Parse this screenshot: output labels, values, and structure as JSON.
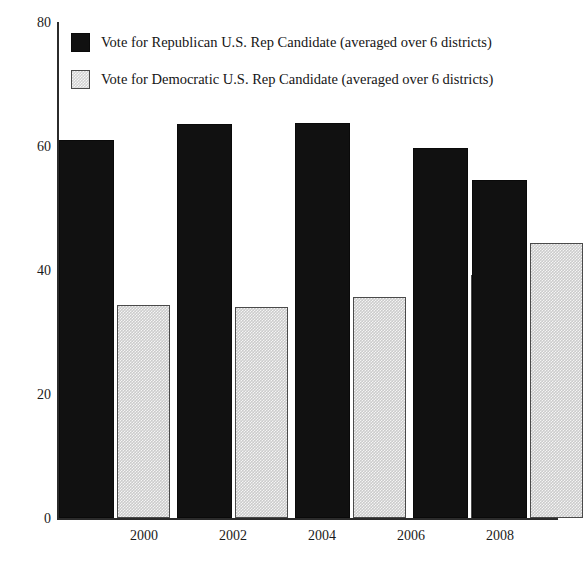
{
  "page": {
    "top_bleed_text": "",
    "background_color": "#ffffff"
  },
  "chart_data": {
    "type": "bar",
    "title": "",
    "subtitle": "",
    "xlabel": "",
    "ylabel": "",
    "categories": [
      "2000",
      "2002",
      "2004",
      "2006",
      "2008"
    ],
    "series": [
      {
        "name": "Vote for Republican U.S. Rep Candidate (averaged over 6 districts)",
        "color": "#111111",
        "values": [
          61.0,
          63.5,
          63.7,
          59.7,
          54.5
        ]
      },
      {
        "name": "Vote for Democratic U.S. Rep Candidate (averaged over 6 districts)",
        "color": "#cbcbcb",
        "values": [
          34.3,
          34.0,
          35.6,
          39.2,
          44.4
        ]
      }
    ],
    "ylim": [
      0,
      80
    ],
    "yticks": [
      0,
      20,
      40,
      60,
      80
    ],
    "ytick_labels": [
      "0",
      "20",
      "40",
      "60",
      "80"
    ],
    "grid": false,
    "legend_position": "upper-left-inside"
  },
  "legend": {
    "items": [
      {
        "label": "Vote for Republican U.S. Rep Candidate (averaged over 6 districts)",
        "swatch": "black-filled-square"
      },
      {
        "label": "Vote for Democratic U.S. Rep Candidate (averaged over 6 districts)",
        "swatch": "gray-hatched-square"
      }
    ]
  }
}
